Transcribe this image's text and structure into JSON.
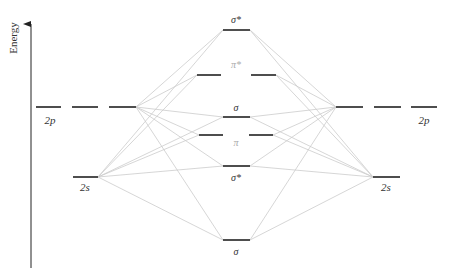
{
  "axis": {
    "label": "Energy",
    "x": 31,
    "y_top": 18,
    "y_bottom": 268
  },
  "colors": {
    "level": "#222222",
    "connector": "#cccccc",
    "label_dark": "#333333",
    "label_light": "#aaaaaa",
    "axis": "#222222"
  },
  "atomic_orbitals": {
    "left_2p": {
      "label": "2p",
      "y": 107,
      "segments": [
        [
          36,
          61
        ],
        [
          72,
          98
        ],
        [
          109,
          136
        ]
      ],
      "label_x": 50,
      "label_y": 124
    },
    "right_2p": {
      "label": "2p",
      "y": 107,
      "segments": [
        [
          336,
          363
        ],
        [
          374,
          401
        ],
        [
          411,
          437
        ]
      ],
      "label_x": 424,
      "label_y": 124
    },
    "left_2s": {
      "label": "2s",
      "y": 177,
      "segments": [
        [
          73,
          98
        ]
      ],
      "label_x": 85,
      "label_y": 191
    },
    "right_2s": {
      "label": "2s",
      "y": 177,
      "segments": [
        [
          373,
          400
        ]
      ],
      "label_x": 386,
      "label_y": 191
    }
  },
  "molecular_orbitals": [
    {
      "id": "sigma_star_2p",
      "label": "σ*",
      "y": 30,
      "segments": [
        [
          223,
          250
        ]
      ],
      "label_x": 236,
      "label_y": 23,
      "label_color": "dark"
    },
    {
      "id": "pi_star_2p",
      "label": "π*",
      "y": 75,
      "segments": [
        [
          197,
          221
        ],
        [
          251,
          276
        ]
      ],
      "label_x": 236,
      "label_y": 68,
      "label_color": "light"
    },
    {
      "id": "sigma_2p",
      "label": "σ",
      "y": 117,
      "segments": [
        [
          223,
          250
        ]
      ],
      "label_x": 236,
      "label_y": 111,
      "label_color": "dark"
    },
    {
      "id": "pi_2p",
      "label": "π",
      "y": 135,
      "segments": [
        [
          199,
          223
        ],
        [
          249,
          273
        ]
      ],
      "label_x": 236,
      "label_y": 146,
      "label_color": "light"
    },
    {
      "id": "sigma_star_2s",
      "label": "σ*",
      "y": 166,
      "segments": [
        [
          223,
          250
        ]
      ],
      "label_x": 236,
      "label_y": 181,
      "label_color": "dark"
    },
    {
      "id": "sigma_2s",
      "label": "σ",
      "y": 240,
      "segments": [
        [
          223,
          250
        ]
      ],
      "label_x": 236,
      "label_y": 255,
      "label_color": "dark"
    }
  ],
  "connectors": [
    [
      136,
      107,
      223,
      30
    ],
    [
      136,
      107,
      197,
      75
    ],
    [
      136,
      107,
      223,
      117
    ],
    [
      136,
      107,
      199,
      135
    ],
    [
      136,
      107,
      223,
      166
    ],
    [
      136,
      107,
      223,
      240
    ],
    [
      98,
      177,
      223,
      30
    ],
    [
      98,
      177,
      197,
      75
    ],
    [
      98,
      177,
      223,
      117
    ],
    [
      98,
      177,
      223,
      166
    ],
    [
      98,
      177,
      223,
      240
    ],
    [
      98,
      177,
      199,
      135
    ],
    [
      336,
      107,
      250,
      30
    ],
    [
      336,
      107,
      276,
      75
    ],
    [
      336,
      107,
      250,
      117
    ],
    [
      336,
      107,
      273,
      135
    ],
    [
      336,
      107,
      250,
      166
    ],
    [
      336,
      107,
      250,
      240
    ],
    [
      373,
      177,
      250,
      30
    ],
    [
      373,
      177,
      276,
      75
    ],
    [
      373,
      177,
      250,
      117
    ],
    [
      373,
      177,
      250,
      166
    ],
    [
      373,
      177,
      250,
      240
    ],
    [
      373,
      177,
      273,
      135
    ]
  ]
}
